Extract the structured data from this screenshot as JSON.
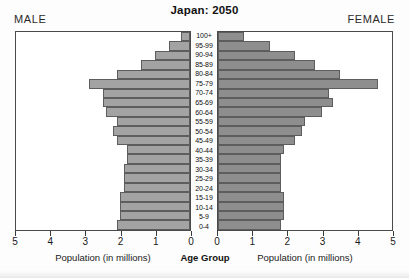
{
  "header": {
    "title": "Japan: 2050",
    "male_label": "MALE",
    "female_label": "FEMALE"
  },
  "axes": {
    "male_caption": "Population (in millions)",
    "female_caption": "Population (in millions)",
    "center_caption": "Age Group",
    "male_ticks": [
      "5",
      "4",
      "3",
      "2",
      "1",
      "0"
    ],
    "female_ticks": [
      "0",
      "1",
      "2",
      "3",
      "4",
      "5"
    ]
  },
  "colors": {
    "male_bar": "#a3a3a3",
    "female_bar": "#8e8e8e",
    "border": "#4a4a4a"
  },
  "chart_data": {
    "type": "bar",
    "title": "Japan: 2050",
    "xlabel": "Population (in millions)",
    "ylabel": "Age Group",
    "xlim": [
      0,
      5
    ],
    "grid": false,
    "legend": [
      "MALE",
      "FEMALE"
    ],
    "orientation": "population-pyramid",
    "categories": [
      "100+",
      "95-99",
      "90-94",
      "85-89",
      "80-84",
      "75-79",
      "70-74",
      "65-69",
      "60-64",
      "55-59",
      "50-54",
      "45-49",
      "40-44",
      "35-39",
      "30-34",
      "25-29",
      "20-24",
      "15-19",
      "10-14",
      "5-9",
      "0-4"
    ],
    "series": [
      {
        "name": "MALE",
        "values": [
          0.25,
          0.6,
          1.0,
          1.4,
          2.1,
          2.9,
          2.5,
          2.5,
          2.4,
          2.1,
          2.2,
          2.1,
          1.8,
          1.8,
          1.9,
          1.9,
          1.9,
          2.0,
          2.0,
          2.0,
          2.1
        ]
      },
      {
        "name": "FEMALE",
        "values": [
          0.75,
          1.5,
          2.2,
          2.8,
          3.5,
          4.6,
          3.2,
          3.3,
          3.0,
          2.5,
          2.4,
          2.2,
          1.9,
          1.8,
          1.8,
          1.8,
          1.8,
          1.9,
          1.9,
          1.9,
          1.8
        ]
      }
    ]
  }
}
